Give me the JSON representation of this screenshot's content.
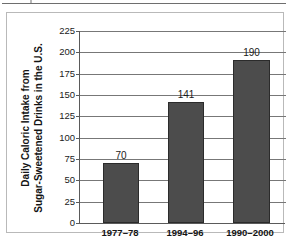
{
  "figure": {
    "has_top_rule": true,
    "border_color": "#b9b9b9"
  },
  "chart_data": {
    "type": "bar",
    "title": "",
    "xlabel": "",
    "ylabel": "Daily Caloric Intake from Sugar-Sweetened Drinks in the U.S.",
    "ylabel_line1": "Daily Caloric Intake from",
    "ylabel_line2": "Sugar-Sweetened Drinks in the U.S.",
    "categories": [
      "1977–78",
      "1994–96",
      "1990–2000"
    ],
    "values": [
      70,
      141,
      190
    ],
    "value_labels": [
      "70",
      "141",
      "190"
    ],
    "ylim": [
      0,
      225
    ],
    "yticks": [
      225,
      200,
      175,
      150,
      125,
      100,
      75,
      50,
      25,
      0
    ],
    "ytick_labels": [
      "225",
      "200",
      "175",
      "150",
      "125",
      "100",
      "75",
      "50",
      "25",
      "0"
    ],
    "grid": true,
    "grid_orientation": "horizontal",
    "legend": null,
    "bar_color": "#4c4c4c",
    "bar_edge_color": "#2b2b2b",
    "gridline_color": "#777777",
    "axis_color": "#5a5a5a"
  }
}
